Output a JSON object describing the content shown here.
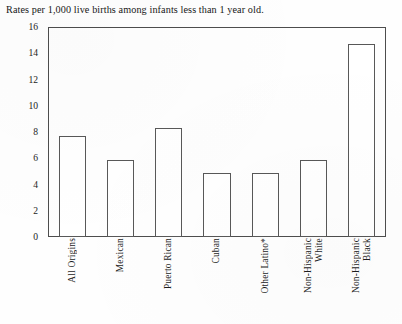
{
  "chart_data": {
    "type": "bar",
    "title": "Rates per 1,000 live births among infants less than 1 year old.",
    "xlabel": "",
    "ylabel": "",
    "ylim": [
      0,
      16
    ],
    "yticks": [
      0,
      2,
      4,
      6,
      8,
      10,
      12,
      14,
      16
    ],
    "ytick_labels": [
      "0",
      "2",
      "4",
      "6",
      "8",
      "10",
      "12",
      "14",
      "16"
    ],
    "grid": false,
    "legend": "none",
    "bar_fill_color": "#ffffff",
    "bar_edge_color": "#585858",
    "frame_color": "#4d4d4d",
    "categories": [
      "All Origins",
      "Mexican",
      "Puerto Rican",
      "Cuban",
      "Other Latino*",
      "Non-Hispanic White",
      "Non-Hispanic Black"
    ],
    "category_lines": [
      [
        "All Origins"
      ],
      [
        "Mexican"
      ],
      [
        "Puerto Rican"
      ],
      [
        "Cuban"
      ],
      [
        "Other Latino*"
      ],
      [
        "Non-Hispanic",
        "White"
      ],
      [
        "Non-Hispanic",
        "Black"
      ]
    ],
    "values": [
      7.7,
      5.9,
      8.3,
      4.9,
      4.9,
      5.9,
      14.7
    ]
  }
}
